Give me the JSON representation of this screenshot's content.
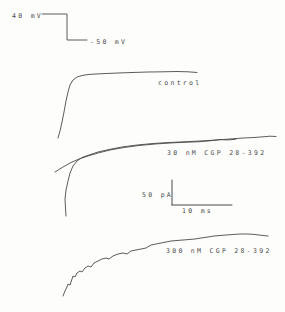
{
  "figure": {
    "colors": {
      "paper": "#fdfdfc",
      "ink": "#4a4a4a"
    },
    "voltage_step": {
      "top_label": "40 mV",
      "bottom_label": "-50 mV"
    },
    "labels": {
      "control": "control",
      "cgp30": "30 nM CGP 28-392",
      "cgp300": "300 nM CGP 28-392"
    },
    "scale_bar": {
      "vertical": "50 pA",
      "horizontal": "10 ms"
    }
  },
  "chart_data": {
    "type": "line",
    "title": "",
    "coordinate_system": "image pixels, y increases downward",
    "legend_position": "labels beside traces",
    "grid": false,
    "voltage_protocol": {
      "from_level": "-50 mV",
      "to_level": "40 mV",
      "step_points": [
        [
          42,
          14
        ],
        [
          67,
          14
        ],
        [
          67,
          40
        ],
        [
          87,
          40
        ]
      ]
    },
    "scale_bars": {
      "vertical_represents": "50 pA",
      "horizontal_represents": "10 ms",
      "vertical_points": [
        [
          172,
          180
        ],
        [
          172,
          205
        ]
      ],
      "horizontal_points": [
        [
          172,
          205
        ],
        [
          232,
          205
        ]
      ]
    },
    "series": [
      {
        "name": "control",
        "points": [
          [
            58,
            138
          ],
          [
            60,
            131
          ],
          [
            62,
            122
          ],
          [
            64,
            112
          ],
          [
            66,
            101
          ],
          [
            68,
            92
          ],
          [
            70,
            85
          ],
          [
            73,
            80
          ],
          [
            77,
            77
          ],
          [
            82,
            75.5
          ],
          [
            88,
            74.5
          ],
          [
            96,
            74
          ],
          [
            106,
            73.5
          ],
          [
            118,
            73
          ],
          [
            132,
            72.5
          ],
          [
            148,
            72
          ],
          [
            163,
            71.8
          ],
          [
            177,
            71.5
          ],
          [
            188,
            71.8
          ],
          [
            197,
            72.5
          ]
        ]
      },
      {
        "name": "30 nM CGP 28-392",
        "points": [
          [
            66,
            216
          ],
          [
            65.5,
            208
          ],
          [
            65,
            199
          ],
          [
            66,
            190
          ],
          [
            68,
            181
          ],
          [
            70,
            173
          ],
          [
            73,
            166
          ],
          [
            77,
            161
          ],
          [
            82,
            157.5
          ],
          [
            89,
            155
          ],
          [
            98,
            152
          ],
          [
            109,
            149.5
          ],
          [
            122,
            147
          ],
          [
            137,
            145
          ],
          [
            153,
            143.5
          ],
          [
            169,
            142.5
          ],
          [
            184,
            141.8
          ],
          [
            200,
            141
          ],
          [
            216,
            140
          ],
          [
            230,
            139
          ],
          [
            243,
            138
          ],
          [
            254,
            137.5
          ],
          [
            263,
            136.8
          ],
          [
            270,
            136.2
          ],
          [
            276,
            136.5
          ]
        ]
      },
      {
        "name": "30 nM CGP 28-392 (superimposed sweep)",
        "points": [
          [
            55,
            172
          ],
          [
            63,
            167
          ],
          [
            71,
            162.5
          ],
          [
            79,
            159
          ],
          [
            88,
            156
          ],
          [
            98,
            153
          ],
          [
            110,
            150
          ],
          [
            124,
            147.5
          ],
          [
            139,
            145.5
          ],
          [
            155,
            144
          ],
          [
            170,
            143
          ],
          [
            184,
            142.3
          ],
          [
            198,
            141.8
          ],
          [
            210,
            140.8
          ],
          [
            220,
            139.6
          ],
          [
            228,
            139.9
          ],
          [
            236,
            139.2
          ]
        ]
      },
      {
        "name": "300 nM CGP 28-392",
        "points": [
          [
            63,
            296
          ],
          [
            65,
            291
          ],
          [
            67,
            287
          ],
          [
            68,
            284
          ],
          [
            70,
            285
          ],
          [
            72,
            279
          ],
          [
            73,
            276
          ],
          [
            75,
            277
          ],
          [
            77,
            273
          ],
          [
            80,
            271
          ],
          [
            82,
            272
          ],
          [
            85,
            268
          ],
          [
            88,
            266
          ],
          [
            91,
            267
          ],
          [
            94,
            263
          ],
          [
            98,
            261
          ],
          [
            102,
            259
          ],
          [
            106,
            258
          ],
          [
            109,
            259
          ],
          [
            113,
            256
          ],
          [
            118,
            254
          ],
          [
            123,
            253
          ],
          [
            127,
            254
          ],
          [
            131,
            251
          ],
          [
            136,
            250
          ],
          [
            141,
            249
          ],
          [
            146,
            248
          ],
          [
            151,
            245
          ],
          [
            156,
            244
          ],
          [
            161,
            243
          ],
          [
            166,
            242
          ],
          [
            171,
            241
          ],
          [
            177,
            240.5
          ],
          [
            183,
            240
          ],
          [
            189,
            239.5
          ],
          [
            195,
            239
          ],
          [
            201,
            238
          ],
          [
            208,
            237
          ],
          [
            214,
            236
          ],
          [
            220,
            235.5
          ],
          [
            226,
            235
          ],
          [
            233,
            234.5
          ],
          [
            240,
            234
          ],
          [
            247,
            234
          ],
          [
            253,
            234.3
          ],
          [
            259,
            235
          ],
          [
            264,
            235.6
          ],
          [
            268,
            236
          ]
        ]
      }
    ]
  }
}
